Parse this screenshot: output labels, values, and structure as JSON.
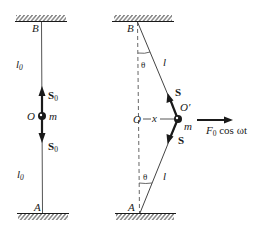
{
  "figure": {
    "left_panel": {
      "top_support_label": "B",
      "bottom_support_label": "A",
      "upper_length_label": "l",
      "upper_length_sub": "0",
      "lower_length_label": "l",
      "lower_length_sub": "0",
      "upper_tension_label": "S",
      "upper_tension_sub": "0",
      "lower_tension_label": "S",
      "lower_tension_sub": "0",
      "equilibrium_label": "O",
      "mass_label": "m"
    },
    "right_panel": {
      "top_support_label": "B",
      "bottom_support_label": "A",
      "upper_angle_label": "θ",
      "lower_angle_label": "θ",
      "upper_length_label": "l",
      "lower_length_label": "l",
      "upper_tension_label": "S",
      "lower_tension_label": "S",
      "equilibrium_label": "O",
      "displacement_label": "x",
      "displaced_point_label": "O′",
      "mass_label": "m",
      "force_label_F": "F",
      "force_label_sub": "0",
      "force_label_rest": " cos ωt"
    },
    "colors": {
      "ink": "#1a1a1a",
      "background": "#ffffff"
    }
  }
}
